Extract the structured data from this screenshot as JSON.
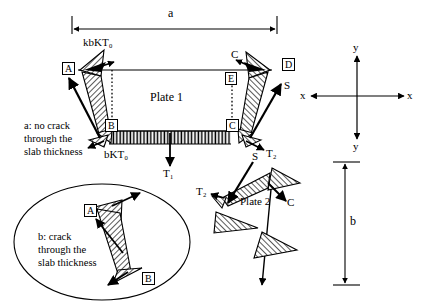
{
  "figure": {
    "title_caption_a": "a: no crack\nthrough the\nslab thickness",
    "title_caption_b": "b: crack\nthrough the\nslab thickness"
  },
  "dimensions": {
    "width_label": "a",
    "height_label": "b"
  },
  "axes": {
    "x_left": "x",
    "x_right": "x",
    "y_top": "y",
    "y_bottom": "y"
  },
  "plate1": {
    "name": "Plate 1",
    "nodes": {
      "A": "A",
      "B": "B",
      "C": "C",
      "D": "D",
      "E": "E"
    },
    "forces": {
      "kbKT0": "kbKT₀",
      "bKT0": "bKT₀",
      "T1": "T₁",
      "T2": "T₂",
      "C_left": "C",
      "S": "S"
    }
  },
  "plate2": {
    "name": "Plate 2",
    "forces": {
      "S": "S",
      "C": "C",
      "T2": "T₂"
    }
  },
  "inset": {
    "caption_line1": "b: crack",
    "caption_line2": "through the",
    "caption_line3": "slab thickness",
    "node_A": "A",
    "node_B": "B"
  },
  "caption_left": {
    "line1": "a: no crack",
    "line2": "through the",
    "line3": "slab thickness"
  },
  "colors": {
    "ink": "#000000",
    "background": "#ffffff",
    "hatch": "#000000"
  }
}
